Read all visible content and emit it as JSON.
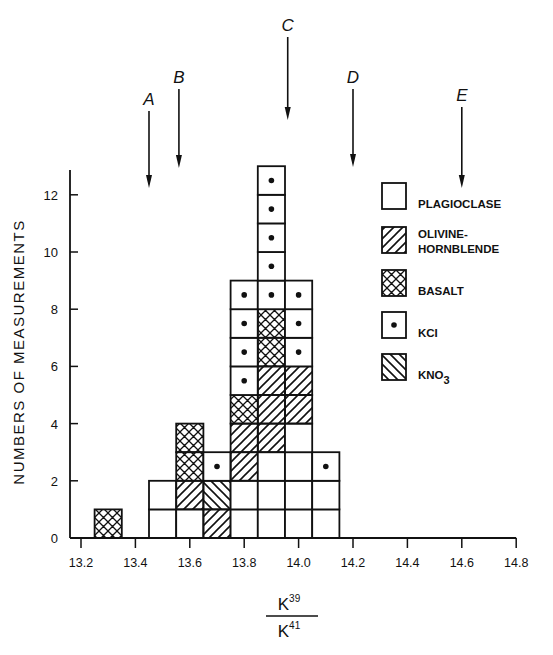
{
  "chart_data": {
    "type": "bar",
    "subtype": "stacked-histogram",
    "title": "",
    "xlabel": "K39 / K41",
    "xlabel_numerator": "K",
    "xlabel_numerator_sup": "39",
    "xlabel_denominator": "K",
    "xlabel_denominator_sup": "41",
    "ylabel": "NUMBERS OF MEASUREMENTS",
    "xlim": [
      13.2,
      14.8
    ],
    "ylim": [
      0,
      13
    ],
    "x_ticks": [
      "13.2",
      "13.4",
      "13.6",
      "13.8",
      "14.0",
      "14.2",
      "14.4",
      "14.6",
      "14.8"
    ],
    "x_tick_values": [
      13.2,
      13.4,
      13.6,
      13.8,
      14.0,
      14.2,
      14.4,
      14.6,
      14.8
    ],
    "y_ticks": [
      "0",
      "2",
      "4",
      "6",
      "8",
      "10",
      "12"
    ],
    "y_tick_values": [
      0,
      2,
      4,
      6,
      8,
      10,
      12
    ],
    "bin_width": 0.1,
    "categories": [
      "13.3",
      "13.5",
      "13.6",
      "13.7",
      "13.8",
      "13.9",
      "14.0",
      "14.1"
    ],
    "series": [
      {
        "key": "plagioclase",
        "name": "PLAGIOCLASE",
        "pattern": "blank",
        "values": [
          0,
          2,
          1,
          0,
          2,
          3,
          4,
          2
        ]
      },
      {
        "key": "olivine",
        "name": "OLIVINE-HORNBLENDE",
        "pattern": "forward-hatch",
        "values": [
          0,
          0,
          1,
          1,
          2,
          3,
          2,
          0
        ]
      },
      {
        "key": "basalt",
        "name": "BASALT",
        "pattern": "cross-hatch",
        "values": [
          1,
          0,
          2,
          0,
          1,
          2,
          0,
          0
        ]
      },
      {
        "key": "kcl",
        "name": "KCl",
        "pattern": "dot",
        "values": [
          0,
          0,
          0,
          1,
          4,
          5,
          3,
          1
        ]
      },
      {
        "key": "kno3",
        "name": "KNO3",
        "pattern": "back-hatch",
        "values": [
          0,
          0,
          0,
          1,
          0,
          0,
          0,
          0
        ]
      }
    ],
    "totals": [
      1,
      2,
      4,
      3,
      9,
      13,
      9,
      3
    ],
    "stacks": [
      {
        "x": 13.3,
        "cells": [
          "basalt"
        ]
      },
      {
        "x": 13.5,
        "cells": [
          "plagioclase",
          "plagioclase"
        ]
      },
      {
        "x": 13.6,
        "cells": [
          "plagioclase",
          "olivine",
          "basalt",
          "basalt"
        ]
      },
      {
        "x": 13.7,
        "cells": [
          "olivine",
          "kno3",
          "kcl"
        ]
      },
      {
        "x": 13.8,
        "cells": [
          "plagioclase",
          "plagioclase",
          "olivine",
          "olivine",
          "basalt",
          "kcl",
          "kcl",
          "kcl",
          "kcl"
        ]
      },
      {
        "x": 13.9,
        "cells": [
          "plagioclase",
          "plagioclase",
          "plagioclase",
          "olivine",
          "olivine",
          "olivine",
          "basalt",
          "basalt",
          "kcl",
          "kcl",
          "kcl",
          "kcl",
          "kcl"
        ]
      },
      {
        "x": 14.0,
        "cells": [
          "plagioclase",
          "plagioclase",
          "plagioclase",
          "plagioclase",
          "olivine",
          "olivine",
          "kcl",
          "kcl",
          "kcl"
        ]
      },
      {
        "x": 14.1,
        "cells": [
          "plagioclase",
          "plagioclase",
          "kcl"
        ]
      }
    ],
    "annotations": [
      {
        "label": "A",
        "x": 13.45,
        "type": "arrow-down"
      },
      {
        "label": "B",
        "x": 13.56,
        "type": "arrow-down"
      },
      {
        "label": "C",
        "x": 13.96,
        "type": "arrow-down"
      },
      {
        "label": "D",
        "x": 14.2,
        "type": "arrow-down"
      },
      {
        "label": "E",
        "x": 14.6,
        "type": "arrow-down"
      }
    ],
    "legend": {
      "position": "right-inside",
      "entries": [
        {
          "key": "plagioclase",
          "lines": [
            "PLAGIOCLASE"
          ]
        },
        {
          "key": "olivine",
          "lines": [
            "OLIVINE-",
            "HORNBLENDE"
          ]
        },
        {
          "key": "basalt",
          "lines": [
            "BASALT"
          ]
        },
        {
          "key": "kcl",
          "lines": [
            "KCI"
          ]
        },
        {
          "key": "kno3",
          "lines": [
            "KNO"
          ],
          "sub": "3"
        }
      ]
    },
    "grid": false
  },
  "colors": {
    "ink": "#111111",
    "background": "#ffffff"
  }
}
